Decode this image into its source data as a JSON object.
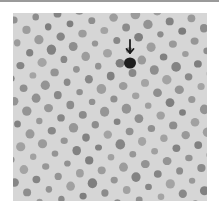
{
  "figure": {
    "background_color": "#d6d6d6",
    "dot_color": "#7c7c7c",
    "marked_dot_color": "#1e1e1e",
    "arrow_color": "#1a1a1a",
    "lattice": {
      "spacing_x": 22,
      "spacing_y": 11.5,
      "row_offset": 11,
      "dot_radius": 4,
      "origin_x": 3,
      "origin_y": 6,
      "angle_deg": -8
    },
    "marked_dot": {
      "x": 117,
      "y": 50,
      "rx": 6,
      "ry": 5.5
    },
    "arrow": {
      "x": 117,
      "y_top": 27,
      "y_tip": 40
    }
  }
}
